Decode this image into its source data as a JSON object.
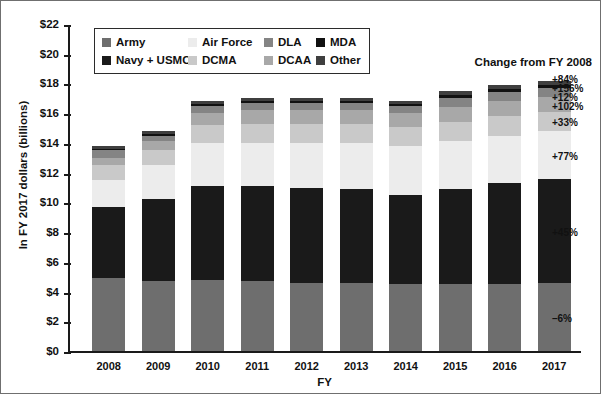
{
  "chart_data": {
    "type": "bar",
    "subtype": "stacked-bar",
    "title": "",
    "xlabel": "FY",
    "ylabel": "In FY 2017 dollars (billions)",
    "ylim": [
      0,
      22
    ],
    "ytick_values": [
      0,
      2,
      4,
      6,
      8,
      10,
      12,
      14,
      16,
      18,
      20,
      22
    ],
    "ytick_labels": [
      "$0",
      "$2",
      "$4",
      "$6",
      "$8",
      "$10",
      "$12",
      "$14",
      "$16",
      "$18",
      "$20",
      "$22"
    ],
    "grid": false,
    "legend_position": "upper-left-inside",
    "categories": [
      "2008",
      "2009",
      "2010",
      "2011",
      "2012",
      "2013",
      "2014",
      "2015",
      "2016",
      "2017"
    ],
    "series": [
      {
        "name": "Army",
        "color": "#6e6e6e",
        "values": [
          4.9,
          4.7,
          4.8,
          4.7,
          4.6,
          4.6,
          4.5,
          4.5,
          4.5,
          4.6
        ]
      },
      {
        "name": "Navy + USMC",
        "color": "#1a1a1a",
        "values": [
          4.8,
          5.5,
          6.3,
          6.4,
          6.4,
          6.3,
          6.0,
          6.4,
          6.8,
          7.0
        ]
      },
      {
        "name": "Air Force",
        "color": "#ececec",
        "values": [
          1.8,
          2.3,
          2.9,
          2.9,
          3.0,
          3.1,
          3.3,
          3.2,
          3.2,
          3.2
        ]
      },
      {
        "name": "DCMA",
        "color": "#c9c9c9",
        "values": [
          1.0,
          1.0,
          1.2,
          1.3,
          1.3,
          1.3,
          1.3,
          1.3,
          1.3,
          1.3
        ]
      },
      {
        "name": "DCAA",
        "color": "#a8a8a8",
        "values": [
          0.5,
          0.6,
          0.8,
          0.9,
          0.9,
          0.9,
          0.9,
          1.0,
          1.0,
          1.0
        ]
      },
      {
        "name": "DLA",
        "color": "#848484",
        "values": [
          0.5,
          0.4,
          0.5,
          0.5,
          0.5,
          0.5,
          0.5,
          0.6,
          0.6,
          0.6
        ]
      },
      {
        "name": "MDA",
        "color": "#111111",
        "values": [
          0.1,
          0.1,
          0.1,
          0.1,
          0.1,
          0.1,
          0.1,
          0.2,
          0.2,
          0.2
        ]
      },
      {
        "name": "Other",
        "color": "#3f3f3f",
        "values": [
          0.2,
          0.2,
          0.2,
          0.2,
          0.2,
          0.2,
          0.2,
          0.3,
          0.3,
          0.3
        ]
      }
    ],
    "totals": [
      13.8,
      14.8,
      16.8,
      17.0,
      17.0,
      17.0,
      16.8,
      17.5,
      17.9,
      18.2
    ]
  },
  "legend": {
    "entries": [
      {
        "label": "Army",
        "color": "#6e6e6e"
      },
      {
        "label": "Air Force",
        "color": "#ececec"
      },
      {
        "label": "DLA",
        "color": "#848484"
      },
      {
        "label": "MDA",
        "color": "#111111"
      },
      {
        "label": "Navy + USMC",
        "color": "#1a1a1a"
      },
      {
        "label": "DCMA",
        "color": "#c9c9c9"
      },
      {
        "label": "DCAA",
        "color": "#a8a8a8"
      },
      {
        "label": "Other",
        "color": "#3f3f3f"
      }
    ]
  },
  "annotations": {
    "title": "Change from FY 2008",
    "items": [
      {
        "label": "+84%",
        "series": "Other"
      },
      {
        "label": "+156%",
        "series": "MDA"
      },
      {
        "label": "+12%",
        "series": "DLA"
      },
      {
        "label": "+102%",
        "series": "DCAA"
      },
      {
        "label": "+33%",
        "series": "DCMA"
      },
      {
        "label": "+77%",
        "series": "Air Force"
      },
      {
        "label": "+45%",
        "series": "Navy + USMC"
      },
      {
        "label": "–6%",
        "series": "Army"
      }
    ]
  }
}
